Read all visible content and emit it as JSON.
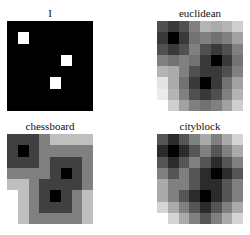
{
  "figure": {
    "panels": [
      {
        "title": "I",
        "values": [
          [
            0,
            0,
            0,
            0,
            0,
            0,
            0,
            0
          ],
          [
            0,
            1,
            0,
            0,
            0,
            0,
            0,
            0
          ],
          [
            0,
            0,
            0,
            0,
            0,
            0,
            0,
            0
          ],
          [
            0,
            0,
            0,
            0,
            0,
            1,
            0,
            0
          ],
          [
            0,
            0,
            0,
            0,
            0,
            0,
            0,
            0
          ],
          [
            0,
            0,
            0,
            0,
            1,
            0,
            0,
            0
          ],
          [
            0,
            0,
            0,
            0,
            0,
            0,
            0,
            0
          ],
          [
            0,
            0,
            0,
            0,
            0,
            0,
            0,
            0
          ]
        ]
      },
      {
        "title": "euclidean",
        "values": [
          [
            1.41,
            1,
            1.41,
            2.24,
            3.16,
            3,
            3.16,
            3.61
          ],
          [
            1,
            0,
            1,
            2,
            2.24,
            2,
            2.24,
            2.83
          ],
          [
            1.41,
            1,
            1.41,
            2.24,
            1.41,
            1,
            1.41,
            2.24
          ],
          [
            2.24,
            2,
            2.24,
            2,
            1,
            0,
            1,
            2
          ],
          [
            3.16,
            3,
            2.24,
            1.41,
            1,
            1,
            1.41,
            2.24
          ],
          [
            4,
            3,
            2,
            1,
            0,
            1,
            2,
            2.83
          ],
          [
            4.12,
            3.16,
            2.24,
            1.41,
            1,
            1.41,
            2.24,
            3.16
          ],
          [
            4.47,
            3.61,
            2.83,
            2.24,
            2,
            2.24,
            2.83,
            3.61
          ]
        ]
      },
      {
        "title": "chessboard",
        "values": [
          [
            1,
            1,
            1,
            2,
            3,
            3,
            3,
            3
          ],
          [
            1,
            0,
            1,
            2,
            2,
            2,
            2,
            2
          ],
          [
            1,
            1,
            1,
            2,
            1,
            1,
            1,
            2
          ],
          [
            2,
            2,
            2,
            2,
            1,
            0,
            1,
            2
          ],
          [
            3,
            3,
            2,
            1,
            1,
            1,
            1,
            2
          ],
          [
            4,
            3,
            2,
            1,
            0,
            1,
            2,
            3
          ],
          [
            4,
            3,
            2,
            1,
            1,
            1,
            2,
            3
          ],
          [
            4,
            3,
            2,
            2,
            2,
            2,
            2,
            3
          ]
        ]
      },
      {
        "title": "cityblock",
        "values": [
          [
            2,
            1,
            2,
            3,
            4,
            3,
            4,
            5
          ],
          [
            1,
            0,
            1,
            2,
            3,
            2,
            3,
            4
          ],
          [
            2,
            1,
            2,
            3,
            2,
            1,
            2,
            3
          ],
          [
            3,
            2,
            3,
            2,
            1,
            0,
            1,
            2
          ],
          [
            4,
            3,
            3,
            2,
            1,
            1,
            2,
            3
          ],
          [
            4,
            3,
            2,
            1,
            0,
            1,
            2,
            3
          ],
          [
            5,
            4,
            3,
            2,
            1,
            2,
            3,
            4
          ],
          [
            6,
            5,
            4,
            3,
            2,
            3,
            4,
            5
          ]
        ]
      }
    ],
    "colormap": {
      "low": "#000000",
      "high": "#ffffff"
    }
  }
}
